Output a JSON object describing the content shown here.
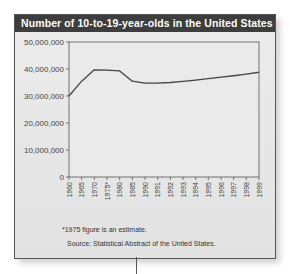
{
  "chart_data": {
    "type": "line",
    "title": "Number of 10-to-19-year-olds in the United States",
    "xlabel": "",
    "ylabel": "",
    "categories": [
      "1960",
      "1965",
      "1970",
      "1975*",
      "1980",
      "1985",
      "1990",
      "1991",
      "1992",
      "1993",
      "1994",
      "1995",
      "1996",
      "1997",
      "1998",
      "1999"
    ],
    "series": [
      {
        "name": "10-to-19-year-olds",
        "values": [
          30000000,
          35500000,
          39700000,
          39600000,
          39300000,
          35500000,
          34800000,
          34800000,
          35000000,
          35400000,
          35900000,
          36400000,
          37000000,
          37500000,
          38100000,
          38800000
        ]
      }
    ],
    "yticks": [
      "0",
      "10,000,000",
      "20,000,000",
      "30,000,000",
      "40,000,000",
      "50,000,000"
    ],
    "ylim": [
      0,
      50000000
    ],
    "grid": false,
    "legend": "none",
    "footnote": "*1975 figure is an estimate.",
    "source": "Source: Statistical Abstract of the United States."
  },
  "colors": {
    "title_bar": "#3d3d3d",
    "line": "#444444",
    "background": "#e6e6e6"
  }
}
